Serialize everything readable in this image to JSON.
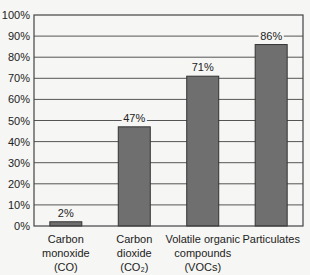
{
  "chart_data": {
    "type": "bar",
    "title": "",
    "xlabel": "",
    "ylabel": "",
    "categories": [
      [
        "Carbon",
        "monoxide",
        "(CO)"
      ],
      [
        "Carbon",
        "dioxide",
        "(CO₂)"
      ],
      [
        "Volatile organic",
        "compounds",
        "(VOCs)"
      ],
      [
        "Particulates"
      ]
    ],
    "values": [
      2,
      47,
      71,
      86
    ],
    "value_labels": [
      "2%",
      "47%",
      "71%",
      "86%"
    ],
    "ylim": [
      0,
      100
    ],
    "yticks": [
      "0%",
      "10%",
      "20%",
      "30%",
      "40%",
      "50%",
      "60%",
      "70%",
      "80%",
      "90%",
      "100%"
    ],
    "grid": true,
    "legend": null,
    "colors": {
      "bar": "#6f6f6f",
      "bar_outline": "#333333",
      "grid": "#555555",
      "background": "#f6f6f4"
    }
  }
}
